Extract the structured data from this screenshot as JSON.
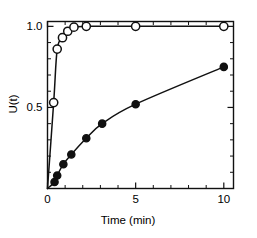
{
  "chart_data": {
    "type": "scatter",
    "title": "",
    "subtitle": "",
    "xlabel": "Time (min)",
    "ylabel": "U(t)",
    "xlim": [
      0,
      10.55
    ],
    "ylim": [
      0,
      1.03
    ],
    "grid": false,
    "legend_position": "none",
    "x_ticks_major": [
      0,
      5,
      10
    ],
    "x_tick_labels": [
      "0",
      "5",
      "10"
    ],
    "x_ticks_minor": [
      1,
      2,
      3,
      4,
      6,
      7,
      8,
      9
    ],
    "y_ticks_major": [
      0.5,
      1.0
    ],
    "y_tick_labels": [
      "0.5",
      "1.0"
    ],
    "y_ticks_minor": [
      0.1,
      0.2,
      0.3,
      0.4,
      0.6,
      0.7,
      0.8,
      0.9
    ],
    "series": [
      {
        "name": "open-circles",
        "marker": "open-circle",
        "x": [
          0.35,
          0.55,
          0.85,
          1.15,
          1.5,
          2.2,
          5.0,
          10.0
        ],
        "y": [
          0.53,
          0.86,
          0.93,
          0.97,
          0.995,
          1.0,
          1.0,
          1.0
        ]
      },
      {
        "name": "filled-circles",
        "marker": "filled-circle",
        "x": [
          0.4,
          0.55,
          0.9,
          1.35,
          2.2,
          3.1,
          5.0,
          10.0
        ],
        "y": [
          0.04,
          0.08,
          0.15,
          0.21,
          0.31,
          0.4,
          0.52,
          0.75
        ]
      }
    ]
  },
  "axis_titles": {
    "x": "Time (min)",
    "y": "U(t)"
  },
  "tick_text": {
    "y_top": "1.0",
    "y_mid": "0.5",
    "x_zero": "0",
    "x_five": "5",
    "x_ten": "10"
  },
  "colors": {
    "ink": "#111111",
    "background": "#ffffff",
    "marker_fill_open": "#ffffff",
    "marker_fill_closed": "#111111"
  }
}
